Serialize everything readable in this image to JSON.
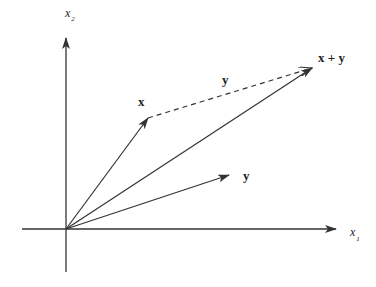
{
  "diagram": {
    "axes": {
      "x1": {
        "label": "x",
        "subscript": "1"
      },
      "x2": {
        "label": "x",
        "subscript": "2"
      }
    },
    "vectors": {
      "x": {
        "label": "x"
      },
      "y": {
        "label": "y"
      },
      "sum": {
        "label": "x + y"
      },
      "y_translated": {
        "label": "y",
        "style": "dashed"
      }
    },
    "colors": {
      "stroke": "#333333",
      "text": "#222222",
      "background": "#ffffff"
    }
  }
}
